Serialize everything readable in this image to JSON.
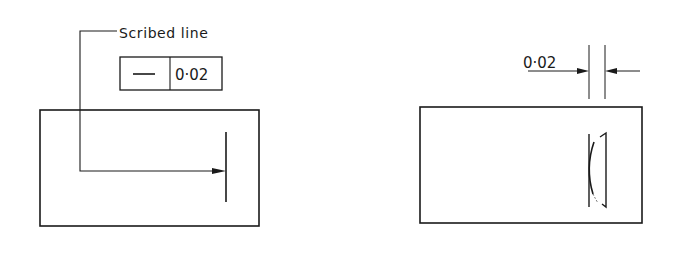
{
  "figure_left": {
    "leader_label": "Scribed line",
    "feature_control_frame": {
      "symbol": "—",
      "symbol_meaning": "straightness",
      "tolerance": "0·02"
    }
  },
  "figure_right": {
    "dimension_label": "0·02"
  },
  "colors": {
    "ink": "#1a1a1a",
    "background": "#ffffff"
  }
}
